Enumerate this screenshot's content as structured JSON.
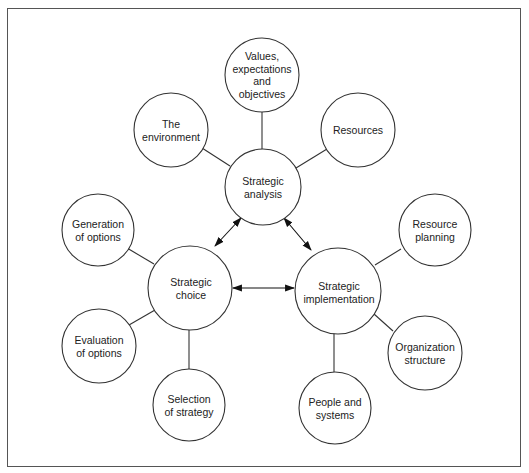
{
  "diagram": {
    "hubs": [
      {
        "id": "analysis",
        "label": "Strategic\nanalysis"
      },
      {
        "id": "choice",
        "label": "Strategic\nchoice"
      },
      {
        "id": "implementation",
        "label": "Strategic\nimplementation"
      }
    ],
    "satellites": {
      "analysis": [
        {
          "label": "Values,\nexpectations\nand\nobjectives"
        },
        {
          "label": "The\nenvironment"
        },
        {
          "label": "Resources"
        }
      ],
      "choice": [
        {
          "label": "Generation\nof options"
        },
        {
          "label": "Evaluation\nof options"
        },
        {
          "label": "Selection\nof strategy"
        }
      ],
      "implementation": [
        {
          "label": "Resource\nplanning"
        },
        {
          "label": "Organization\nstructure"
        },
        {
          "label": "People and\nsystems"
        }
      ]
    },
    "arrows": [
      {
        "from": "analysis",
        "to": "choice",
        "type": "bidirectional"
      },
      {
        "from": "analysis",
        "to": "implementation",
        "type": "bidirectional"
      },
      {
        "from": "choice",
        "to": "implementation",
        "type": "bidirectional"
      }
    ]
  }
}
